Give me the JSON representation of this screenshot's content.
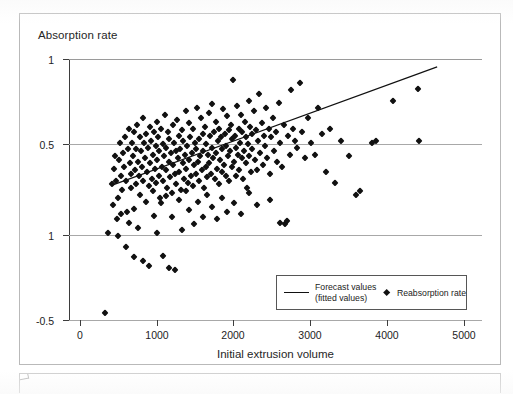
{
  "figure": {
    "caption_placeholder": ""
  },
  "chart_data": {
    "type": "scatter",
    "title": "",
    "ylabel": "Absorption rate",
    "xlabel": "Initial extrusion volume",
    "xlim": [
      0,
      5000
    ],
    "x_ticks": [
      0,
      1000,
      2000,
      3000,
      4000,
      5000
    ],
    "x_tick_labels": [
      "0",
      "1000",
      "2000",
      "3000",
      "4000",
      "5000"
    ],
    "y_tick_labels": [
      "1",
      "0.5",
      "1",
      "-0.5"
    ],
    "y_tick_values": [
      1,
      0.5,
      0,
      -0.5
    ],
    "grid": "horizontal",
    "legend_position": "bottom-center",
    "legend": [
      {
        "key": "fitted",
        "label": "Forecast values\n(fitted values)",
        "label_line1": "Forecast values",
        "label_line2": "(fitted values)",
        "marker": "line"
      },
      {
        "key": "scatter",
        "label": "Reabsorption rate",
        "marker": "diamond"
      }
    ],
    "series": [
      {
        "name": "Reabsorption rate",
        "type": "scatter",
        "marker": "diamond",
        "color": "#111111",
        "points": [
          [
            330,
            -0.46
          ],
          [
            360,
            0.0
          ],
          [
            420,
            0.28
          ],
          [
            430,
            0.16
          ],
          [
            440,
            0.37
          ],
          [
            455,
            0.44
          ],
          [
            470,
            0.3
          ],
          [
            500,
            0.2
          ],
          [
            510,
            0.42
          ],
          [
            520,
            0.52
          ],
          [
            530,
            0.33
          ],
          [
            545,
            0.25
          ],
          [
            560,
            0.46
          ],
          [
            575,
            0.38
          ],
          [
            590,
            0.55
          ],
          [
            600,
            0.3
          ],
          [
            615,
            0.12
          ],
          [
            620,
            0.48
          ],
          [
            640,
            0.6
          ],
          [
            650,
            0.4
          ],
          [
            660,
            0.26
          ],
          [
            670,
            0.34
          ],
          [
            680,
            0.52
          ],
          [
            690,
            0.44
          ],
          [
            700,
            0.14
          ],
          [
            705,
            0.58
          ],
          [
            715,
            0.36
          ],
          [
            725,
            0.48
          ],
          [
            735,
            0.28
          ],
          [
            745,
            0.62
          ],
          [
            755,
            0.41
          ],
          [
            765,
            0.33
          ],
          [
            775,
            0.55
          ],
          [
            785,
            0.22
          ],
          [
            795,
            0.47
          ],
          [
            805,
            0.38
          ],
          [
            815,
            0.66
          ],
          [
            825,
            0.3
          ],
          [
            835,
            0.52
          ],
          [
            845,
            0.43
          ],
          [
            855,
            0.18
          ],
          [
            865,
            0.57
          ],
          [
            875,
            0.35
          ],
          [
            885,
            0.49
          ],
          [
            895,
            0.27
          ],
          [
            905,
            0.61
          ],
          [
            915,
            0.4
          ],
          [
            925,
            0.53
          ],
          [
            935,
            0.31
          ],
          [
            945,
            0.45
          ],
          [
            955,
            0.24
          ],
          [
            965,
            0.58
          ],
          [
            975,
            0.37
          ],
          [
            985,
            0.5
          ],
          [
            995,
            0.29
          ],
          [
            1000,
            0.64
          ],
          [
            1005,
            0.42
          ],
          [
            1015,
            0.55
          ],
          [
            1025,
            0.33
          ],
          [
            1035,
            0.47
          ],
          [
            1045,
            0.2
          ],
          [
            1055,
            0.6
          ],
          [
            1065,
            0.38
          ],
          [
            1075,
            0.51
          ],
          [
            1085,
            0.3
          ],
          [
            1095,
            0.44
          ],
          [
            1105,
            0.68
          ],
          [
            1115,
            0.36
          ],
          [
            1125,
            0.49
          ],
          [
            1135,
            0.26
          ],
          [
            1145,
            0.58
          ],
          [
            1155,
            0.41
          ],
          [
            1165,
            0.54
          ],
          [
            1175,
            0.32
          ],
          [
            1185,
            0.46
          ],
          [
            1195,
            0.23
          ],
          [
            1205,
            0.62
          ],
          [
            1215,
            0.39
          ],
          [
            1225,
            0.52
          ],
          [
            1235,
            0.34
          ],
          [
            1245,
            0.47
          ],
          [
            1255,
            0.28
          ],
          [
            1265,
            0.65
          ],
          [
            1275,
            0.43
          ],
          [
            1285,
            0.56
          ],
          [
            1295,
            0.35
          ],
          [
            1305,
            0.48
          ],
          [
            1315,
            0.25
          ],
          [
            1325,
            0.59
          ],
          [
            1335,
            0.4
          ],
          [
            1345,
            0.53
          ],
          [
            1355,
            0.31
          ],
          [
            1365,
            0.45
          ],
          [
            1375,
            0.7
          ],
          [
            1385,
            0.37
          ],
          [
            1395,
            0.5
          ],
          [
            1405,
            0.29
          ],
          [
            1415,
            0.63
          ],
          [
            1425,
            0.42
          ],
          [
            1435,
            0.55
          ],
          [
            1445,
            0.33
          ],
          [
            1455,
            0.46
          ],
          [
            1465,
            0.27
          ],
          [
            1475,
            0.6
          ],
          [
            1485,
            0.39
          ],
          [
            1495,
            0.52
          ],
          [
            1505,
            0.34
          ],
          [
            1515,
            0.48
          ],
          [
            1525,
            0.72
          ],
          [
            1535,
            0.41
          ],
          [
            1545,
            0.54
          ],
          [
            1555,
            0.3
          ],
          [
            1565,
            0.44
          ],
          [
            1575,
            0.66
          ],
          [
            1585,
            0.36
          ],
          [
            1595,
            0.57
          ],
          [
            1605,
            0.47
          ],
          [
            1615,
            0.26
          ],
          [
            1625,
            0.61
          ],
          [
            1635,
            0.38
          ],
          [
            1645,
            0.51
          ],
          [
            1655,
            0.32
          ],
          [
            1665,
            0.45
          ],
          [
            1675,
            0.69
          ],
          [
            1685,
            0.4
          ],
          [
            1695,
            0.56
          ],
          [
            1705,
            0.34
          ],
          [
            1715,
            0.49
          ],
          [
            1725,
            0.74
          ],
          [
            1735,
            0.43
          ],
          [
            1745,
            0.58
          ],
          [
            1755,
            0.31
          ],
          [
            1765,
            0.46
          ],
          [
            1775,
            0.64
          ],
          [
            1785,
            0.37
          ],
          [
            1795,
            0.53
          ],
          [
            1805,
            0.28
          ],
          [
            1815,
            0.6
          ],
          [
            1825,
            0.42
          ],
          [
            1835,
            0.55
          ],
          [
            1845,
            0.35
          ],
          [
            1855,
            0.48
          ],
          [
            1865,
            0.71
          ],
          [
            1875,
            0.39
          ],
          [
            1885,
            0.57
          ],
          [
            1895,
            0.33
          ],
          [
            1905,
            0.5
          ],
          [
            1915,
            0.67
          ],
          [
            1925,
            0.44
          ],
          [
            1935,
            0.59
          ],
          [
            1945,
            0.3
          ],
          [
            1955,
            0.47
          ],
          [
            1965,
            0.62
          ],
          [
            1975,
            0.38
          ],
          [
            1985,
            0.54
          ],
          [
            1995,
            0.88
          ],
          [
            2005,
            0.41
          ],
          [
            2015,
            0.56
          ],
          [
            2025,
            0.33
          ],
          [
            2035,
            0.49
          ],
          [
            2045,
            0.73
          ],
          [
            2055,
            0.45
          ],
          [
            2065,
            0.6
          ],
          [
            2075,
            0.36
          ],
          [
            2085,
            0.52
          ],
          [
            2095,
            0.68
          ],
          [
            2105,
            0.43
          ],
          [
            2115,
            0.58
          ],
          [
            2125,
            0.31
          ],
          [
            2135,
            0.47
          ],
          [
            2145,
            0.64
          ],
          [
            2155,
            0.4
          ],
          [
            2165,
            0.55
          ],
          [
            2175,
            0.26
          ],
          [
            2185,
            0.51
          ],
          [
            2195,
            0.76
          ],
          [
            2205,
            0.44
          ],
          [
            2215,
            0.61
          ],
          [
            2225,
            0.35
          ],
          [
            2235,
            0.57
          ],
          [
            2245,
            0.48
          ],
          [
            2260,
            0.7
          ],
          [
            2275,
            0.42
          ],
          [
            2290,
            0.59
          ],
          [
            2305,
            0.36
          ],
          [
            2320,
            0.53
          ],
          [
            2335,
            0.8
          ],
          [
            2350,
            0.46
          ],
          [
            2365,
            0.63
          ],
          [
            2380,
            0.39
          ],
          [
            2395,
            0.56
          ],
          [
            2410,
            0.5
          ],
          [
            2425,
            0.72
          ],
          [
            2440,
            0.43
          ],
          [
            2455,
            0.6
          ],
          [
            2470,
            0.34
          ],
          [
            2490,
            0.55
          ],
          [
            2510,
            0.66
          ],
          [
            2530,
            0.47
          ],
          [
            2550,
            0.58
          ],
          [
            2570,
            0.41
          ],
          [
            2590,
            0.75
          ],
          [
            2610,
            0.52
          ],
          [
            2630,
            0.38
          ],
          [
            2650,
            0.62
          ],
          [
            2670,
            0.05
          ],
          [
            2690,
            0.07
          ],
          [
            2710,
            0.56
          ],
          [
            2730,
            0.45
          ],
          [
            2750,
            0.82
          ],
          [
            2770,
            0.6
          ],
          [
            2800,
            0.53
          ],
          [
            2830,
            0.49
          ],
          [
            2860,
            0.86
          ],
          [
            2890,
            0.58
          ],
          [
            2930,
            0.43
          ],
          [
            2970,
            0.66
          ],
          [
            3010,
            0.52
          ],
          [
            3060,
            0.45
          ],
          [
            3100,
            0.72
          ],
          [
            3150,
            0.57
          ],
          [
            3200,
            0.35
          ],
          [
            3260,
            0.6
          ],
          [
            3320,
            0.29
          ],
          [
            3400,
            0.53
          ],
          [
            3500,
            0.44
          ],
          [
            3600,
            0.22
          ],
          [
            3650,
            0.24
          ],
          [
            3800,
            0.52
          ],
          [
            3860,
            0.53
          ],
          [
            4080,
            0.76
          ],
          [
            4400,
            0.83
          ],
          [
            4420,
            0.53
          ],
          [
            480,
            0.08
          ],
          [
            500,
            -0.02
          ],
          [
            530,
            0.11
          ],
          [
            600,
            -0.08
          ],
          [
            640,
            0.06
          ],
          [
            700,
            -0.14
          ],
          [
            760,
            0.03
          ],
          [
            820,
            -0.16
          ],
          [
            900,
            -0.19
          ],
          [
            960,
            0.1
          ],
          [
            1000,
            0.0
          ],
          [
            1050,
            0.17
          ],
          [
            1080,
            -0.13
          ],
          [
            1120,
            0.21
          ],
          [
            1160,
            -0.2
          ],
          [
            1200,
            0.09
          ],
          [
            1240,
            -0.21
          ],
          [
            1290,
            0.19
          ],
          [
            1330,
            0.02
          ],
          [
            1380,
            0.24
          ],
          [
            1420,
            0.13
          ],
          [
            1480,
            0.05
          ],
          [
            1540,
            0.18
          ],
          [
            1600,
            0.09
          ],
          [
            1660,
            0.22
          ],
          [
            1720,
            0.15
          ],
          [
            1790,
            0.08
          ],
          [
            1850,
            0.2
          ],
          [
            1920,
            0.12
          ],
          [
            2000,
            0.17
          ],
          [
            2100,
            0.11
          ],
          [
            2200,
            0.23
          ],
          [
            2300,
            0.16
          ],
          [
            2480,
            0.19
          ],
          [
            2600,
            0.06
          ]
        ]
      },
      {
        "name": "Forecast values (fitted values)",
        "type": "line",
        "color": "#111111",
        "x_start": 420,
        "y_start": 0.275,
        "x_end": 4650,
        "y_end": 0.955
      }
    ]
  }
}
